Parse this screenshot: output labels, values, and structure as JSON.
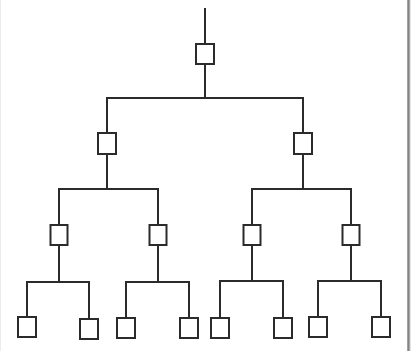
{
  "diagram": {
    "type": "binary-tree",
    "levels": 4,
    "colors": {
      "line": "#2b2b2b",
      "node_fill": "#ffffff",
      "node_stroke": "#2b2b2b",
      "background": "#ffffff",
      "frame_border": "#808080"
    },
    "stroke_width": 2,
    "root_stem": {
      "x": 205,
      "y1": 9,
      "y2": 44
    },
    "nodes": [
      {
        "id": "n0",
        "level": 0,
        "cx": 205,
        "y": 44,
        "w": 18,
        "h": 20
      },
      {
        "id": "n1",
        "level": 1,
        "cx": 107,
        "y": 133,
        "w": 18,
        "h": 21,
        "parent": "n0"
      },
      {
        "id": "n2",
        "level": 1,
        "cx": 303,
        "y": 133,
        "w": 18,
        "h": 21,
        "parent": "n0"
      },
      {
        "id": "n3",
        "level": 2,
        "cx": 59,
        "y": 225,
        "w": 17,
        "h": 20,
        "parent": "n1"
      },
      {
        "id": "n4",
        "level": 2,
        "cx": 158,
        "y": 225,
        "w": 17,
        "h": 20,
        "parent": "n1"
      },
      {
        "id": "n5",
        "level": 2,
        "cx": 252,
        "y": 225,
        "w": 17,
        "h": 20,
        "parent": "n2"
      },
      {
        "id": "n6",
        "level": 2,
        "cx": 351,
        "y": 225,
        "w": 17,
        "h": 20,
        "parent": "n2"
      },
      {
        "id": "n7",
        "level": 3,
        "cx": 27,
        "y": 317,
        "w": 18,
        "h": 20,
        "parent": "n3"
      },
      {
        "id": "n8",
        "level": 3,
        "cx": 89,
        "y": 319,
        "w": 18,
        "h": 20,
        "parent": "n3"
      },
      {
        "id": "n9",
        "level": 3,
        "cx": 126,
        "y": 318,
        "w": 18,
        "h": 20,
        "parent": "n4"
      },
      {
        "id": "n10",
        "level": 3,
        "cx": 189,
        "y": 318,
        "w": 18,
        "h": 20,
        "parent": "n4"
      },
      {
        "id": "n11",
        "level": 3,
        "cx": 220,
        "y": 318,
        "w": 18,
        "h": 20,
        "parent": "n5"
      },
      {
        "id": "n12",
        "level": 3,
        "cx": 283,
        "y": 318,
        "w": 18,
        "h": 20,
        "parent": "n5"
      },
      {
        "id": "n13",
        "level": 3,
        "cx": 318,
        "y": 317,
        "w": 18,
        "h": 20,
        "parent": "n6"
      },
      {
        "id": "n14",
        "level": 3,
        "cx": 381,
        "y": 317,
        "w": 18,
        "h": 20,
        "parent": "n6"
      }
    ],
    "branch_bars": [
      {
        "parent": "n0",
        "y": 98,
        "x1": 107,
        "x2": 303
      },
      {
        "parent": "n1",
        "y": 189,
        "x1": 59,
        "x2": 158
      },
      {
        "parent": "n2",
        "y": 189,
        "x1": 252,
        "x2": 351
      },
      {
        "parent": "n3",
        "y": 282,
        "x1": 27,
        "x2": 89
      },
      {
        "parent": "n4",
        "y": 282,
        "x1": 126,
        "x2": 189
      },
      {
        "parent": "n5",
        "y": 281,
        "x1": 220,
        "x2": 283
      },
      {
        "parent": "n6",
        "y": 281,
        "x1": 318,
        "x2": 381
      }
    ]
  }
}
